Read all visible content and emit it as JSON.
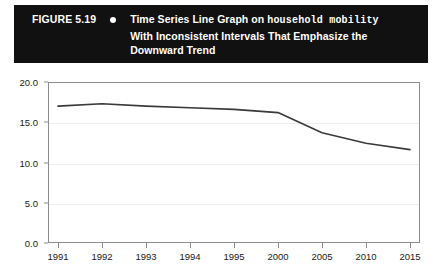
{
  "figure": {
    "label": "FIGURE 5.19",
    "bullet_icon": "bullet-dot-icon",
    "caption_line_1_prefix": "Time Series Line Graph on ",
    "caption_line_1_mono": "household mobility",
    "caption_line_2": "With Inconsistent Intervals That Emphasize the",
    "caption_line_3": "Downward Trend",
    "header_background": "#111111",
    "header_text_color": "#ffffff"
  },
  "chart_data": {
    "type": "line",
    "title": "Time Series Line Graph on household mobility With Inconsistent Intervals That Emphasize the Downward Trend",
    "xlabel": "",
    "ylabel": "",
    "categories": [
      "1991",
      "1992",
      "1993",
      "1994",
      "1995",
      "2000",
      "2005",
      "2010",
      "2015"
    ],
    "values": [
      17.0,
      17.3,
      17.0,
      16.8,
      16.6,
      16.2,
      13.7,
      12.4,
      11.6
    ],
    "series": [
      {
        "name": "household mobility",
        "values": [
          17.0,
          17.3,
          17.0,
          16.8,
          16.6,
          16.2,
          13.7,
          12.4,
          11.6
        ]
      }
    ],
    "ylim": [
      0.0,
      20.0
    ],
    "ytick_labels": [
      "0.0",
      "5.0",
      "10.0",
      "15.0",
      "20.0"
    ],
    "ytick_values": [
      0.0,
      5.0,
      10.0,
      15.0,
      20.0
    ],
    "xtick_labels": [
      "1991",
      "1992",
      "1993",
      "1994",
      "1995",
      "2000",
      "2005",
      "2010",
      "2015"
    ],
    "grid": true,
    "legend": false,
    "line_color": "#3a3a3a",
    "grid_color": "#ededed",
    "axis_color": "#8c8c8c",
    "note": "X axis uses inconsistent intervals: 1-year steps from 1991 to 1995, then 5-year steps to 2015, which visually exaggerates the downward trend."
  }
}
